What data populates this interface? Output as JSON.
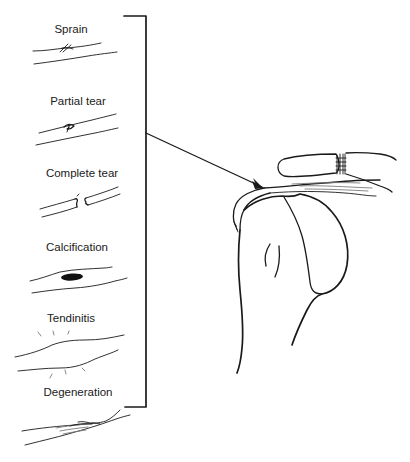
{
  "diagram": {
    "type": "anatomical-illustration",
    "labels": [
      {
        "id": "sprain",
        "text": "Sprain"
      },
      {
        "id": "partial_tear",
        "text": "Partial tear"
      },
      {
        "id": "complete_tear",
        "text": "Complete tear"
      },
      {
        "id": "calcification",
        "text": "Calcification"
      },
      {
        "id": "tendinitis",
        "text": "Tendinitis"
      },
      {
        "id": "degeneration",
        "text": "Degeneration"
      }
    ],
    "stroke_color": "#1a1a1a",
    "background": "#ffffff"
  },
  "labels": {
    "sprain": "Sprain",
    "partial_tear": "Partial tear",
    "complete_tear": "Complete tear",
    "calcification": "Calcification",
    "tendinitis": "Tendinitis",
    "degeneration": "Degeneration"
  }
}
